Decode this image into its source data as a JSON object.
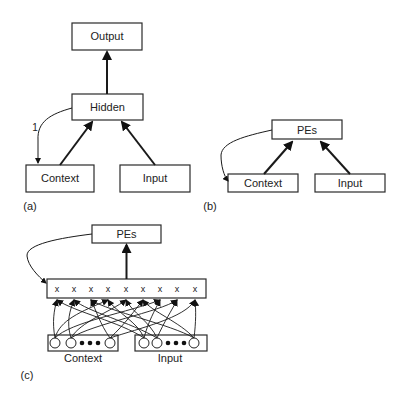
{
  "panels": [
    {
      "id": "a",
      "caption": "(a)",
      "nodes": {
        "output": "Output",
        "hidden": "Hidden",
        "context": "Context",
        "input": "Input"
      },
      "edge_labels": {
        "recurrent": "1"
      },
      "edges": [
        {
          "from": "Hidden",
          "to": "Output"
        },
        {
          "from": "Context",
          "to": "Hidden"
        },
        {
          "from": "Input",
          "to": "Hidden"
        },
        {
          "from": "Hidden",
          "to": "Context",
          "label": "1",
          "style": "curved-thin"
        }
      ]
    },
    {
      "id": "b",
      "caption": "(b)",
      "nodes": {
        "pes": "PEs",
        "context": "Context",
        "input": "Input"
      },
      "edges": [
        {
          "from": "Context",
          "to": "PEs"
        },
        {
          "from": "Input",
          "to": "PEs"
        },
        {
          "from": "PEs",
          "to": "Context",
          "style": "curved-thin"
        }
      ]
    },
    {
      "id": "c",
      "caption": "(c)",
      "nodes": {
        "pes": "PEs",
        "context": "Context",
        "input": "Input"
      },
      "product_units": [
        "x",
        "x",
        "x",
        "x",
        "x",
        "x",
        "x",
        "x",
        "x"
      ],
      "edges": [
        {
          "from": "ProductLayer",
          "to": "PEs"
        },
        {
          "from": "PEs",
          "to": "ProductLayer",
          "style": "curved-thin"
        },
        {
          "from": "Context units",
          "to": "ProductLayer",
          "style": "fully-connected"
        },
        {
          "from": "Input units",
          "to": "ProductLayer",
          "style": "fully-connected"
        }
      ]
    }
  ]
}
